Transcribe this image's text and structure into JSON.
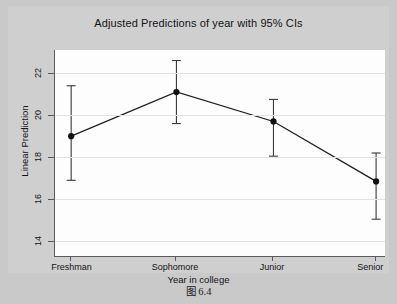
{
  "caption": "图 6.4",
  "chart_data": {
    "type": "line",
    "title": "Adjusted Predictions of year with 95% CIs",
    "xlabel": "Year in college",
    "ylabel": "Linear Prediction",
    "categories": [
      "Freshman",
      "Sophomore",
      "Junior",
      "Senior"
    ],
    "values": [
      19.0,
      21.1,
      19.7,
      16.85
    ],
    "ci_lower": [
      16.9,
      19.6,
      18.05,
      15.05
    ],
    "ci_upper": [
      21.4,
      22.6,
      20.75,
      18.2
    ],
    "error_bars": "95% confidence intervals",
    "yticks": [
      14,
      16,
      18,
      20,
      22
    ],
    "ytick_labels": [
      "14",
      "16",
      "18",
      "20",
      "22"
    ],
    "ylim": [
      13.3,
      23.1
    ],
    "grid": "horizontal",
    "legend": "none",
    "marker": "filled-circle",
    "series": [
      {
        "name": "Linear Prediction",
        "values": [
          19.0,
          21.1,
          19.7,
          16.85
        ]
      }
    ],
    "colors": {
      "line": "#1f1f1f",
      "marker": "#111111",
      "errorbar": "#3a3a3a",
      "grid": "#e2e2e2",
      "axis": "#5a5a5a",
      "plot_background": "#fdfdfd",
      "figure_background": "#cfcfcf"
    }
  }
}
